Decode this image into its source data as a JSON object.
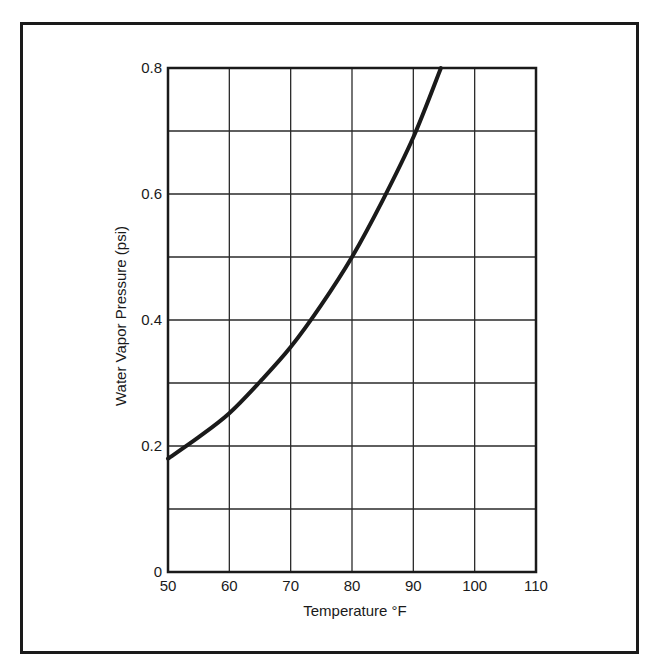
{
  "chart_data": {
    "type": "line",
    "title": "",
    "xlabel": "Temperature °F",
    "ylabel": "Water Vapor Pressure (psi)",
    "xlim": [
      50,
      110
    ],
    "ylim": [
      0,
      0.8
    ],
    "x_ticks": [
      50,
      60,
      70,
      80,
      90,
      100,
      110
    ],
    "x_tick_labels": [
      "50",
      "60",
      "70",
      "80",
      "90",
      "100",
      "110"
    ],
    "y_gridlines": [
      0,
      0.1,
      0.2,
      0.3,
      0.4,
      0.5,
      0.6,
      0.7,
      0.8
    ],
    "y_tick_labels": [
      {
        "value": 0,
        "label": "0"
      },
      {
        "value": 0.2,
        "label": "0.2"
      },
      {
        "value": 0.4,
        "label": "0.4"
      },
      {
        "value": 0.6,
        "label": "0.6"
      },
      {
        "value": 0.8,
        "label": "0.8"
      }
    ],
    "grid": true,
    "legend": null,
    "series": [
      {
        "name": "Water vapor pressure",
        "color": "#1a1a1a",
        "x": [
          50,
          55,
          60,
          65,
          70,
          75,
          80,
          85,
          90,
          94.5
        ],
        "values": [
          0.18,
          0.214,
          0.252,
          0.302,
          0.357,
          0.424,
          0.5,
          0.59,
          0.69,
          0.8
        ]
      }
    ]
  }
}
